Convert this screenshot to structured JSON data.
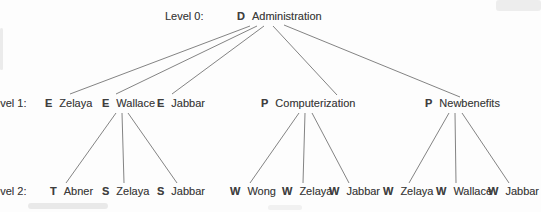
{
  "figure": {
    "title_node": "D Administration",
    "background": "#fdfdfd",
    "text_color": "#3e3e3e",
    "line_color": "#6f6f6f"
  },
  "levels": [
    {
      "label": "Level 0:",
      "x": 165,
      "y": 10
    },
    {
      "label": "Level 1:",
      "x": -12,
      "y": 97
    },
    {
      "label": "Level 2:",
      "x": -12,
      "y": 185
    }
  ],
  "nodes": [
    {
      "type": "D",
      "name": "Administration",
      "x": 237,
      "y": 10
    },
    {
      "type": "E",
      "name": "Zelaya",
      "x": 45,
      "y": 97
    },
    {
      "type": "E",
      "name": "Wallace",
      "x": 102,
      "y": 97
    },
    {
      "type": "E",
      "name": "Jabbar",
      "x": 157,
      "y": 97
    },
    {
      "type": "P",
      "name": "Computerization",
      "x": 261,
      "y": 97
    },
    {
      "type": "P",
      "name": "Newbenefits",
      "x": 425,
      "y": 97
    },
    {
      "type": "T",
      "name": "Abner",
      "x": 50,
      "y": 185
    },
    {
      "type": "S",
      "name": "Zelaya",
      "x": 102,
      "y": 185
    },
    {
      "type": "S",
      "name": "Jabbar",
      "x": 157,
      "y": 185
    },
    {
      "type": "W",
      "name": "Wong",
      "x": 230,
      "y": 185
    },
    {
      "type": "W",
      "name": "Zelaya",
      "x": 282,
      "y": 185
    },
    {
      "type": "W",
      "name": "Jabbar",
      "x": 329,
      "y": 185
    },
    {
      "type": "W",
      "name": "Zelaya",
      "x": 383,
      "y": 185
    },
    {
      "type": "W",
      "name": "Wallace",
      "x": 436,
      "y": 185
    },
    {
      "type": "W",
      "name": "Jabbar",
      "x": 488,
      "y": 185
    }
  ],
  "edges": [
    [
      250,
      26,
      70,
      94
    ],
    [
      257,
      26,
      116,
      94
    ],
    [
      264,
      26,
      172,
      94
    ],
    [
      273,
      26,
      337,
      95
    ],
    [
      284,
      25,
      460,
      97
    ],
    [
      116,
      113,
      66,
      183
    ],
    [
      122,
      113,
      124,
      183
    ],
    [
      128,
      113,
      177,
      183
    ],
    [
      299,
      113,
      250,
      183
    ],
    [
      305,
      113,
      303,
      183
    ],
    [
      312,
      113,
      349,
      183
    ],
    [
      449,
      113,
      409,
      183
    ],
    [
      455,
      113,
      456,
      183
    ],
    [
      462,
      113,
      509,
      183
    ]
  ]
}
